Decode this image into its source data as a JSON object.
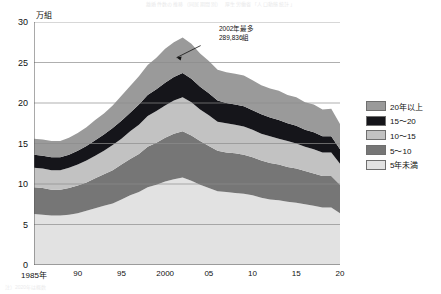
{
  "header": {
    "title": "離婚件数の推移（同居期間別）　厚生労働省「人口動態統計」",
    "source_note": "注）2020年は概数"
  },
  "axes": {
    "y_unit": "万組",
    "y_ticks": [
      "30",
      "25",
      "20",
      "15",
      "10",
      "5",
      "0"
    ],
    "y_min": 0,
    "y_max": 30,
    "x_ticks": [
      "1985年",
      "90",
      "95",
      "2000",
      "05",
      "10",
      "15",
      "20"
    ],
    "x_tick_years": [
      1985,
      1990,
      1995,
      2000,
      2005,
      2010,
      2015,
      2020
    ],
    "x_min": 1985,
    "x_max": 2020
  },
  "annotation": {
    "line1": "2002年最多",
    "line2": "289,836組"
  },
  "legend": {
    "items": [
      {
        "label": "20年以上",
        "color": "#9a9a9a"
      },
      {
        "label": "15～20",
        "color": "#15151a"
      },
      {
        "label": "10～15",
        "color": "#c2c2c2"
      },
      {
        "label": "5～10",
        "color": "#767676"
      },
      {
        "label": "5年未満",
        "color": "#e2e2e2"
      }
    ]
  },
  "chart_data": {
    "type": "area",
    "stacked": true,
    "title": "離婚件数の推移（同居期間別）",
    "xlabel": "",
    "ylabel": "万組",
    "ylim": [
      0,
      30
    ],
    "xlim": [
      1985,
      2020
    ],
    "grid": "horizontal",
    "legend_position": "right",
    "x": [
      1985,
      1986,
      1987,
      1988,
      1989,
      1990,
      1991,
      1992,
      1993,
      1994,
      1995,
      1996,
      1997,
      1998,
      1999,
      2000,
      2001,
      2002,
      2003,
      2004,
      2005,
      2006,
      2007,
      2008,
      2009,
      2010,
      2011,
      2012,
      2013,
      2014,
      2015,
      2016,
      2017,
      2018,
      2019,
      2020
    ],
    "series": [
      {
        "name": "5年未満",
        "color": "#e2e2e2",
        "values": [
          6.3,
          6.2,
          6.1,
          6.1,
          6.2,
          6.4,
          6.7,
          7.0,
          7.3,
          7.6,
          8.1,
          8.6,
          9.0,
          9.6,
          9.9,
          10.3,
          10.6,
          10.8,
          10.4,
          9.9,
          9.5,
          9.1,
          9.0,
          8.9,
          8.8,
          8.6,
          8.3,
          8.1,
          8.0,
          7.8,
          7.7,
          7.5,
          7.3,
          7.1,
          7.1,
          6.4
        ]
      },
      {
        "name": "5～10",
        "color": "#767676",
        "values": [
          3.3,
          3.3,
          3.2,
          3.2,
          3.3,
          3.4,
          3.5,
          3.7,
          3.9,
          4.1,
          4.3,
          4.5,
          4.7,
          5.0,
          5.2,
          5.4,
          5.6,
          5.7,
          5.6,
          5.4,
          5.2,
          5.0,
          4.9,
          4.9,
          4.8,
          4.7,
          4.6,
          4.5,
          4.4,
          4.3,
          4.2,
          4.1,
          4.0,
          3.9,
          3.9,
          3.5
        ]
      },
      {
        "name": "10～15",
        "color": "#c2c2c2",
        "values": [
          2.4,
          2.4,
          2.4,
          2.4,
          2.5,
          2.6,
          2.7,
          2.8,
          2.9,
          3.1,
          3.2,
          3.4,
          3.6,
          3.8,
          3.9,
          4.0,
          4.1,
          4.2,
          4.1,
          3.9,
          3.8,
          3.6,
          3.6,
          3.5,
          3.5,
          3.4,
          3.3,
          3.3,
          3.2,
          3.2,
          3.1,
          3.0,
          3.0,
          2.9,
          2.9,
          2.6
        ]
      },
      {
        "name": "15～20",
        "color": "#15151a",
        "values": [
          1.6,
          1.6,
          1.6,
          1.6,
          1.6,
          1.7,
          1.8,
          1.9,
          2.0,
          2.1,
          2.2,
          2.3,
          2.5,
          2.6,
          2.7,
          2.8,
          2.9,
          3.0,
          2.9,
          2.8,
          2.7,
          2.6,
          2.5,
          2.5,
          2.5,
          2.4,
          2.4,
          2.3,
          2.3,
          2.2,
          2.2,
          2.1,
          2.1,
          2.0,
          2.0,
          1.8
        ]
      },
      {
        "name": "20年以上",
        "color": "#9a9a9a",
        "values": [
          2.0,
          2.0,
          2.0,
          2.0,
          2.1,
          2.2,
          2.3,
          2.5,
          2.6,
          2.8,
          3.1,
          3.3,
          3.5,
          3.7,
          3.9,
          4.2,
          4.3,
          4.4,
          4.3,
          4.1,
          4.0,
          3.8,
          3.8,
          3.8,
          3.8,
          3.7,
          3.6,
          3.6,
          3.6,
          3.5,
          3.5,
          3.4,
          3.4,
          3.3,
          3.4,
          3.1
        ]
      }
    ],
    "annotations": [
      {
        "text": "2002年最多 289,836組",
        "x": 2002,
        "y": 26.1
      }
    ]
  }
}
